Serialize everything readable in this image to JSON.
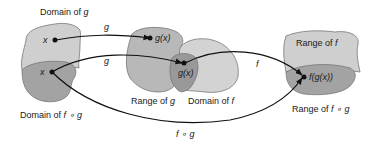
{
  "diagram": {
    "colors": {
      "light_region": "#cfcfcf",
      "mid_region": "#b3b3b3",
      "dark_region": "#9a9a9a",
      "stroke": "#777777",
      "arrow": "#111111"
    },
    "regions": {
      "domain_g": {
        "label_prefix": "Domain of ",
        "label_var": "g"
      },
      "domain_fog": {
        "label_prefix": "Domain of ",
        "label_var": "f ∘ g"
      },
      "range_g": {
        "label_prefix": "Range of ",
        "label_var": "g"
      },
      "domain_f": {
        "label_prefix": "Domain of ",
        "label_var": "f"
      },
      "range_f": {
        "label_prefix": "Range of ",
        "label_var": "f"
      },
      "range_fog": {
        "label_prefix": "Range of ",
        "label_var": "f ∘ g"
      }
    },
    "points": {
      "x_top": "x",
      "x_bottom": "x",
      "gx_top": "g(x)",
      "gx_mid": "g(x)",
      "fgx": "f(g(x))"
    },
    "arrows": {
      "g_top": "g",
      "g_bottom": "g",
      "f": "f",
      "fog": "f ∘ g"
    }
  }
}
